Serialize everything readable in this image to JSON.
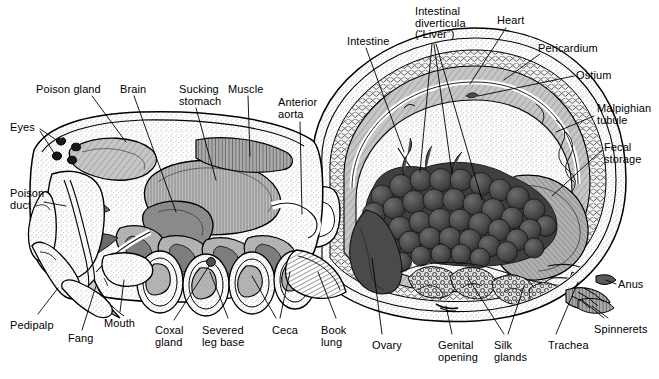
{
  "figure": {
    "view": "lateral cutaway",
    "style": "black-and-white scientific line engraving with stipple and hatch shading",
    "palette": {
      "background": "#ffffff",
      "outline": "#000000",
      "stipple_light": "#e9e9e9",
      "tissue_mid": "#b9b9b9",
      "tissue_dark": "#8a8a8a",
      "muscle_gray": "#9a9a9a",
      "diverticula_dark": "#4f4f4f",
      "diverticula_darker": "#3a3a3a",
      "label_text": "#000000",
      "leader_line": "#000000"
    }
  },
  "labels": [
    {
      "id": "poison-gland",
      "text": "Poison gland",
      "x": 36,
      "y": 84,
      "align": "left",
      "lines": [
        "Poison gland"
      ]
    },
    {
      "id": "brain",
      "text": "Brain",
      "x": 120,
      "y": 84,
      "align": "left",
      "lines": [
        "Brain"
      ]
    },
    {
      "id": "sucking-stomach",
      "text": "Sucking stomach",
      "x": 179,
      "y": 84,
      "align": "left",
      "lines": [
        "Sucking",
        "stomach"
      ]
    },
    {
      "id": "muscle",
      "text": "Muscle",
      "x": 228,
      "y": 84,
      "align": "left",
      "lines": [
        "Muscle"
      ]
    },
    {
      "id": "anterior-aorta",
      "text": "Anterior aorta",
      "x": 278,
      "y": 97,
      "align": "left",
      "lines": [
        "Anterior",
        "aorta"
      ]
    },
    {
      "id": "eyes",
      "text": "Eyes",
      "x": 10,
      "y": 122,
      "align": "left",
      "lines": [
        "Eyes"
      ]
    },
    {
      "id": "poison-duct",
      "text": "Poison duct",
      "x": 10,
      "y": 188,
      "align": "left",
      "lines": [
        "Poison",
        "duct"
      ]
    },
    {
      "id": "pedipalp",
      "text": "Pedipalp",
      "x": 10,
      "y": 320,
      "align": "left",
      "lines": [
        "Pedipalp"
      ]
    },
    {
      "id": "fang",
      "text": "Fang",
      "x": 68,
      "y": 333,
      "align": "left",
      "lines": [
        "Fang"
      ]
    },
    {
      "id": "mouth",
      "text": "Mouth",
      "x": 104,
      "y": 318,
      "align": "left",
      "lines": [
        "Mouth"
      ]
    },
    {
      "id": "coxal-gland",
      "text": "Coxal gland",
      "x": 155,
      "y": 325,
      "align": "left",
      "lines": [
        "Coxal",
        "gland"
      ]
    },
    {
      "id": "severed-leg-base",
      "text": "Severed leg base",
      "x": 202,
      "y": 325,
      "align": "left",
      "lines": [
        "Severed",
        "leg base"
      ]
    },
    {
      "id": "ceca",
      "text": "Ceca",
      "x": 272,
      "y": 325,
      "align": "left",
      "lines": [
        "Ceca"
      ]
    },
    {
      "id": "book-lung",
      "text": "Book lung",
      "x": 321,
      "y": 325,
      "align": "left",
      "lines": [
        "Book",
        "lung"
      ]
    },
    {
      "id": "ovary",
      "text": "Ovary",
      "x": 372,
      "y": 340,
      "align": "left",
      "lines": [
        "Ovary"
      ]
    },
    {
      "id": "genital-opening",
      "text": "Genital opening",
      "x": 438,
      "y": 340,
      "align": "left",
      "lines": [
        "Genital",
        "opening"
      ]
    },
    {
      "id": "silk-glands",
      "text": "Silk glands",
      "x": 494,
      "y": 340,
      "align": "left",
      "lines": [
        "Silk",
        "glands"
      ]
    },
    {
      "id": "trachea",
      "text": "Trachea",
      "x": 548,
      "y": 340,
      "align": "left",
      "lines": [
        "Trachea"
      ]
    },
    {
      "id": "spinnerets",
      "text": "Spinnerets",
      "x": 594,
      "y": 324,
      "align": "left",
      "lines": [
        "Spinnerets"
      ]
    },
    {
      "id": "intestine",
      "text": "Intestine",
      "x": 347,
      "y": 36,
      "align": "left",
      "lines": [
        "Intestine"
      ]
    },
    {
      "id": "intestinal-diverticula",
      "text": "Intestinal diverticula (“Liver”)",
      "x": 415,
      "y": 6,
      "align": "left",
      "lines": [
        "Intestinal",
        "diverticula",
        "(“Liver”)"
      ]
    },
    {
      "id": "heart",
      "text": "Heart",
      "x": 497,
      "y": 15,
      "align": "left",
      "lines": [
        "Heart"
      ]
    },
    {
      "id": "pericardium",
      "text": "Pericardium",
      "x": 538,
      "y": 43,
      "align": "left",
      "lines": [
        "Pericardium"
      ]
    },
    {
      "id": "ostium",
      "text": "Ostium",
      "x": 576,
      "y": 70,
      "align": "left",
      "lines": [
        "Ostium"
      ]
    },
    {
      "id": "malpighian-tubule",
      "text": "Malpighian tubule",
      "x": 597,
      "y": 103,
      "align": "left",
      "lines": [
        "Malpighian",
        "tubule"
      ]
    },
    {
      "id": "fecal-storage",
      "text": "Fecal storage",
      "x": 604,
      "y": 142,
      "align": "left",
      "lines": [
        "Fecal",
        "storage"
      ]
    },
    {
      "id": "anus",
      "text": "Anus",
      "x": 618,
      "y": 279,
      "align": "left",
      "lines": [
        "Anus"
      ]
    }
  ],
  "anatomy_parts": [
    "poison gland",
    "brain",
    "sucking stomach",
    "muscle",
    "anterior aorta",
    "eyes",
    "poison duct",
    "pedipalp",
    "fang",
    "mouth",
    "coxal gland",
    "severed leg base",
    "ceca",
    "book lung",
    "ovary",
    "genital opening",
    "silk glands",
    "trachea",
    "spinnerets",
    "intestine",
    "intestinal diverticula (“Liver”)",
    "heart",
    "pericardium",
    "ostium",
    "Malpighian tubule",
    "fecal storage",
    "anus"
  ]
}
